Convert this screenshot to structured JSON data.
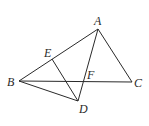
{
  "figure": {
    "type": "geometry-diagram",
    "points": {
      "A": {
        "label": "A",
        "x": 98,
        "y": 29
      },
      "B": {
        "label": "B",
        "x": 19,
        "y": 81
      },
      "C": {
        "label": "C",
        "x": 132,
        "y": 82
      },
      "D": {
        "label": "D",
        "x": 78,
        "y": 101
      },
      "E": {
        "label": "E",
        "x": 52,
        "y": 59
      },
      "F": {
        "label": "F",
        "x": 85,
        "y": 81
      }
    },
    "segments": [
      "AB",
      "AC",
      "BC",
      "AD",
      "BD",
      "ED"
    ]
  }
}
